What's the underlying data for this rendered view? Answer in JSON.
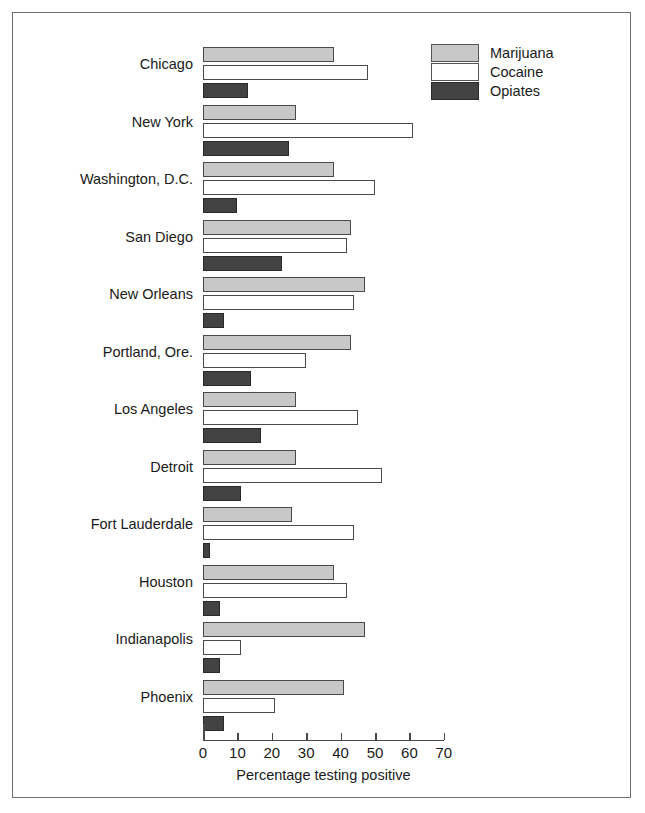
{
  "chart_data": {
    "type": "bar",
    "orientation": "horizontal",
    "title": "",
    "xlabel": "Percentage testing positive",
    "ylabel": "",
    "xlim": [
      0,
      70
    ],
    "xticks": [
      0,
      10,
      20,
      30,
      40,
      50,
      60,
      70
    ],
    "grid": false,
    "legend_position": "top-right",
    "categories": [
      "Chicago",
      "New York",
      "Washington, D.C.",
      "San Diego",
      "New Orleans",
      "Portland, Ore.",
      "Los Angeles",
      "Detroit",
      "Fort Lauderdale",
      "Houston",
      "Indianapolis",
      "Phoenix"
    ],
    "series": [
      {
        "name": "Marijuana",
        "color": "#c8c8c8",
        "values": [
          38,
          27,
          38,
          43,
          47,
          43,
          27,
          27,
          26,
          38,
          47,
          41
        ]
      },
      {
        "name": "Cocaine",
        "color": "#ffffff",
        "values": [
          48,
          61,
          50,
          42,
          44,
          30,
          45,
          52,
          44,
          42,
          11,
          21
        ]
      },
      {
        "name": "Opiates",
        "color": "#434343",
        "values": [
          13,
          25,
          10,
          23,
          6,
          14,
          17,
          11,
          2,
          5,
          5,
          6
        ]
      }
    ]
  }
}
